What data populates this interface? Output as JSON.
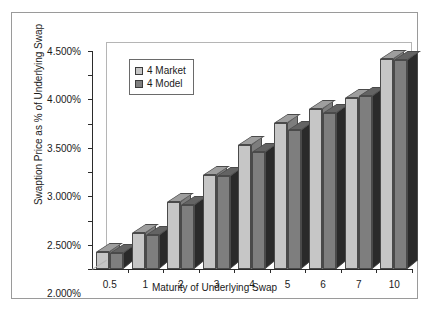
{
  "chart_data": {
    "type": "bar",
    "title": "",
    "xlabel": "Maturity of Underlying Swap",
    "ylabel": "Swaption Price as % of Underlying Swap",
    "categories": [
      "0.5",
      "1",
      "2",
      "3",
      "4",
      "5",
      "6",
      "7",
      "10"
    ],
    "series": [
      {
        "name": "4 Market",
        "color": "#c6c6c6",
        "values": [
          0.35,
          0.75,
          1.38,
          1.95,
          2.55,
          3.01,
          3.3,
          3.52,
          4.33
        ]
      },
      {
        "name": "4 Model",
        "color": "#7e7e7e",
        "values": [
          0.34,
          0.7,
          1.33,
          1.93,
          2.41,
          2.86,
          3.22,
          3.57,
          4.31
        ]
      }
    ],
    "ylim": [
      0,
      4.5
    ],
    "ytick_values": [
      0,
      0.5,
      1.0,
      1.5,
      2.0,
      2.5,
      3.0,
      3.5,
      4.0,
      4.5
    ],
    "ytick_labels": [
      "0.000%",
      "0.500%",
      "1.000%",
      "1.500%",
      "2.000%",
      "2.500%",
      "3.000%",
      "3.500%",
      "4.000%",
      "4.500%"
    ],
    "grid": false,
    "legend_position": "upper-left-inside",
    "legend_entries": [
      "4 Market",
      "4 Model"
    ],
    "unit": "%",
    "style": "3d-clustered-column"
  }
}
